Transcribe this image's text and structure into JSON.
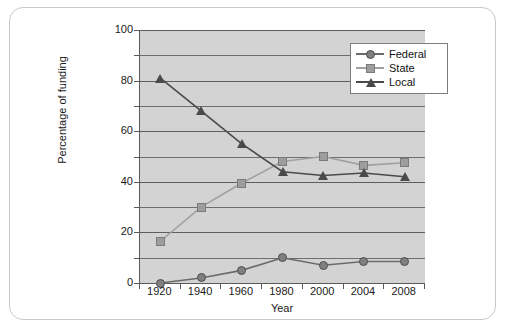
{
  "chart_data": {
    "type": "line",
    "title": "",
    "xlabel": "Year",
    "ylabel": "Percentage of funding",
    "categories": [
      "1920",
      "1940",
      "1960",
      "1980",
      "2000",
      "2004",
      "2008"
    ],
    "ylim": [
      0,
      100
    ],
    "yticks": [
      0,
      20,
      40,
      60,
      80,
      100
    ],
    "yticklabels": [
      "0",
      "20",
      "40",
      "60",
      "80",
      "100"
    ],
    "minor_gridline_step": 10,
    "grid": true,
    "legend_position": "top-right",
    "series": [
      {
        "name": "Federal",
        "marker": "circle",
        "color": "#808080",
        "line_color": "#6b6b6b",
        "values": [
          0,
          2,
          5,
          10,
          7,
          8.5,
          8.5
        ]
      },
      {
        "name": "State",
        "marker": "square",
        "color": "#9d9d9d",
        "line_color": "#a0a0a0",
        "values": [
          16.5,
          30,
          39.5,
          48,
          50,
          46.5,
          47.5
        ]
      },
      {
        "name": "Local",
        "marker": "triangle",
        "color": "#4a4a4a",
        "line_color": "#4a4a4a",
        "values": [
          81,
          68,
          55,
          44,
          42.5,
          43.5,
          42
        ]
      }
    ],
    "plot_background": "#d3d3d3",
    "gridline_color": "#6e6e6e",
    "axis_color": "#5a5a5a"
  },
  "legend": {
    "items": [
      {
        "label": "Federal"
      },
      {
        "label": "State"
      },
      {
        "label": "Local"
      }
    ]
  }
}
